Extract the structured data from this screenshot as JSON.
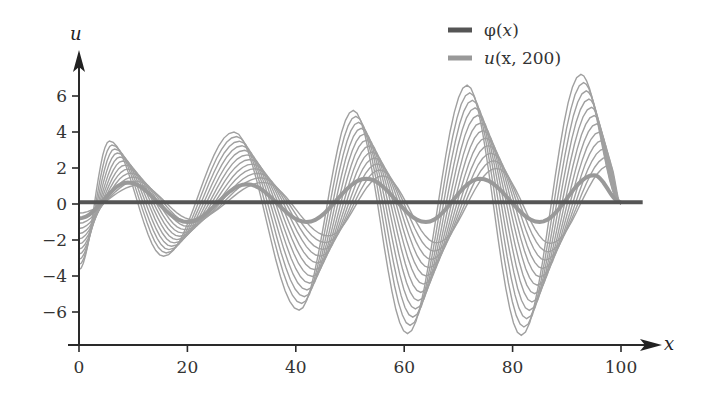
{
  "chart_data": {
    "type": "line",
    "title": "",
    "xlabel": "x",
    "ylabel": "u",
    "xlim": [
      0,
      104
    ],
    "ylim": [
      -7.8,
      7.8
    ],
    "x_ticks": [
      0,
      20,
      40,
      60,
      80,
      100
    ],
    "x_tick_labels": [
      "0",
      "20",
      "40",
      "60",
      "80",
      "100"
    ],
    "y_ticks": [
      -6,
      -4,
      -2,
      0,
      2,
      4,
      6
    ],
    "y_tick_labels": [
      "−6",
      "−4",
      "−2",
      "0",
      "2",
      "4",
      "6"
    ],
    "grid": false,
    "legend_position": "top-right",
    "legend": [
      {
        "label_main": "φ(",
        "label_var": "x",
        "label_end": ")",
        "color": "#555555",
        "width": 4
      },
      {
        "label_main": "",
        "label_var": "u",
        "label_end": "(x, 200)",
        "color": "#999999",
        "width": 4
      }
    ],
    "series": [
      {
        "name": "φ(x)",
        "style": "thick-dark",
        "color": "#555555",
        "x": [
          0,
          104
        ],
        "y": [
          0.1,
          0.1
        ]
      },
      {
        "name": "u(x, 200)",
        "style": "medium-gray",
        "color": "#999999",
        "x_range": [
          0,
          100
        ],
        "peaks": [
          {
            "x": 9,
            "y": 1.2
          },
          {
            "x": 20,
            "y": -1.0
          },
          {
            "x": 31,
            "y": 1.1
          },
          {
            "x": 42,
            "y": -1.0
          },
          {
            "x": 53,
            "y": 1.4
          },
          {
            "x": 64,
            "y": -1.0
          },
          {
            "x": 74,
            "y": 1.4
          },
          {
            "x": 85,
            "y": -1.0
          },
          {
            "x": 95,
            "y": 1.6
          }
        ]
      },
      {
        "name": "u(x, t) family",
        "style": "thin-gray",
        "color": "#a0a0a0",
        "count": 12,
        "x_range": [
          0,
          100
        ],
        "max_envelope_peaks": [
          {
            "x": 8,
            "y": 3.5
          },
          {
            "x": 18,
            "y": -2.9
          },
          {
            "x": 31,
            "y": 4.0
          },
          {
            "x": 43,
            "y": -5.9
          },
          {
            "x": 53,
            "y": 5.2
          },
          {
            "x": 63,
            "y": -7.2
          },
          {
            "x": 74,
            "y": 6.6
          },
          {
            "x": 84,
            "y": -7.3
          },
          {
            "x": 95,
            "y": 7.2
          }
        ]
      }
    ]
  },
  "legend": {
    "phi": {
      "name": "φ",
      "open": "(",
      "var": "x",
      "close": ")"
    },
    "u": {
      "name": "u",
      "args": "(x, 200)",
      "var": "u"
    }
  },
  "axes": {
    "x_label": "x",
    "y_label": "u"
  }
}
